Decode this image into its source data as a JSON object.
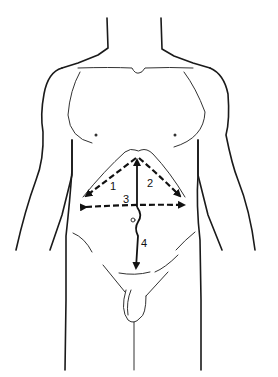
{
  "figure": {
    "line_color": "#111111",
    "background": "#ffffff"
  },
  "incisions": [
    {
      "id": 1,
      "label": "1",
      "style": "dashed",
      "description": "left subcostal arm of chevron"
    },
    {
      "id": 2,
      "label": "2",
      "style": "dashed",
      "description": "right subcostal arm of chevron"
    },
    {
      "id": 3,
      "label": "3",
      "style": "dashed",
      "description": "transverse upper abdominal"
    },
    {
      "id": 4,
      "label": "4",
      "style": "solid",
      "description": "midline vertical, skirting umbilicus"
    }
  ]
}
